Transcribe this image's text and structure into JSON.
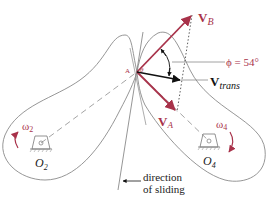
{
  "diagram": {
    "contact_point_label": "A",
    "angle_theta_label": "θ",
    "vectors": {
      "vb": {
        "main": "V",
        "sub": "B"
      },
      "va": {
        "main": "V",
        "sub": "A"
      },
      "vtrans": {
        "main": "V",
        "sub": "trans"
      }
    },
    "phi_label": "ϕ = 54°",
    "phi_value_deg": 54,
    "omega2": {
      "main": "ω",
      "sub": "2"
    },
    "omega4": {
      "main": "ω",
      "sub": "4"
    },
    "pivot2": {
      "main": "O",
      "sub": "2"
    },
    "pivot4": {
      "main": "O",
      "sub": "4"
    },
    "sliding_label_line1": "direction",
    "sliding_label_line2": "of sliding"
  },
  "colors": {
    "vector_red": "#a8324a",
    "outline_gray": "#8a8a8a",
    "text_dark": "#222222",
    "black": "#111111"
  }
}
